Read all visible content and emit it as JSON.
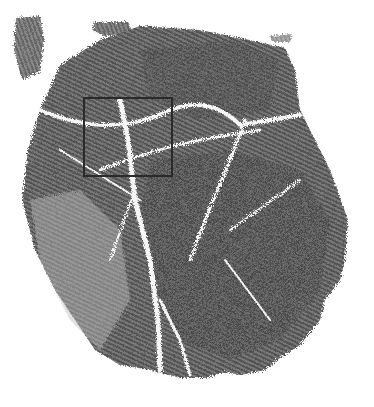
{
  "image": {
    "subject": "palmprint",
    "background": "#ffffff",
    "ink_color": "#4a4a4a",
    "crease_color": "#f4f4f4"
  },
  "roi": {
    "x": 83,
    "y": 97,
    "width": 90,
    "height": 80,
    "border_color": "#2a2a2a"
  }
}
